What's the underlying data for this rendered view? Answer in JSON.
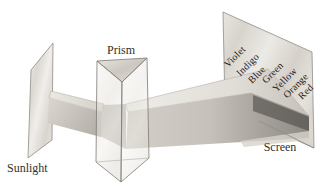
{
  "figure": {
    "labels": {
      "sunlight": "Sunlight",
      "prism": "Prism",
      "screen": "Screen"
    },
    "spectrum_labels": [
      "Violet",
      "Indigo",
      "Blue",
      "Green",
      "Yellow",
      "Orange",
      "Red"
    ],
    "colors": {
      "background": "#ffffff",
      "outline": "#8f8b85",
      "label_text": "#33302b",
      "spectrum_text": "#23201c",
      "beam_dark": "#5f5d59",
      "surface_light": "#e6e3de"
    }
  }
}
